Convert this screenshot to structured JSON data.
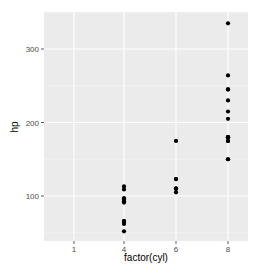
{
  "chart_data": {
    "type": "scatter",
    "title": "",
    "xlabel": "factor(cyl)",
    "ylabel": "hp",
    "categories": [
      "1",
      "4",
      "6",
      "8"
    ],
    "y_ticks": [
      100,
      200,
      300
    ],
    "ylim": [
      50,
      335
    ],
    "grid": true,
    "legend": null,
    "colors": {
      "panel_background": "#ebebeb",
      "grid_major": "#ffffff",
      "point": "#000000",
      "tick_label": "#4d4d4d"
    },
    "points": [
      {
        "x": "4",
        "y": 52
      },
      {
        "x": "4",
        "y": 62
      },
      {
        "x": "4",
        "y": 65
      },
      {
        "x": "4",
        "y": 66
      },
      {
        "x": "4",
        "y": 66
      },
      {
        "x": "4",
        "y": 91
      },
      {
        "x": "4",
        "y": 93
      },
      {
        "x": "4",
        "y": 95
      },
      {
        "x": "4",
        "y": 97
      },
      {
        "x": "4",
        "y": 109
      },
      {
        "x": "4",
        "y": 113
      },
      {
        "x": "6",
        "y": 105
      },
      {
        "x": "6",
        "y": 110
      },
      {
        "x": "6",
        "y": 110
      },
      {
        "x": "6",
        "y": 110
      },
      {
        "x": "6",
        "y": 123
      },
      {
        "x": "6",
        "y": 123
      },
      {
        "x": "6",
        "y": 175
      },
      {
        "x": "8",
        "y": 150
      },
      {
        "x": "8",
        "y": 150
      },
      {
        "x": "8",
        "y": 175
      },
      {
        "x": "8",
        "y": 175
      },
      {
        "x": "8",
        "y": 180
      },
      {
        "x": "8",
        "y": 180
      },
      {
        "x": "8",
        "y": 180
      },
      {
        "x": "8",
        "y": 205
      },
      {
        "x": "8",
        "y": 215
      },
      {
        "x": "8",
        "y": 230
      },
      {
        "x": "8",
        "y": 245
      },
      {
        "x": "8",
        "y": 245
      },
      {
        "x": "8",
        "y": 264
      },
      {
        "x": "8",
        "y": 335
      }
    ]
  }
}
